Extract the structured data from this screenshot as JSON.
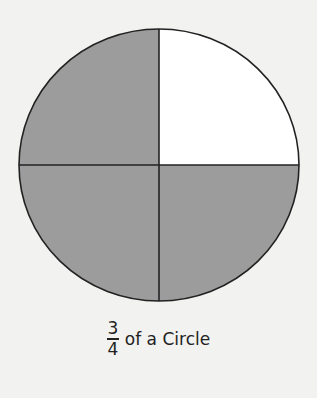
{
  "diagram": {
    "shape": "circle",
    "parts": 4,
    "shaded_parts": 3,
    "unshaded_quadrant": "top-right",
    "colors": {
      "shaded": "#9c9c9c",
      "unshaded": "#ffffff",
      "stroke": "#222222",
      "background": "#f2f2f0"
    }
  },
  "caption": {
    "numerator": "3",
    "denominator": "4",
    "text": "of a Circle"
  }
}
